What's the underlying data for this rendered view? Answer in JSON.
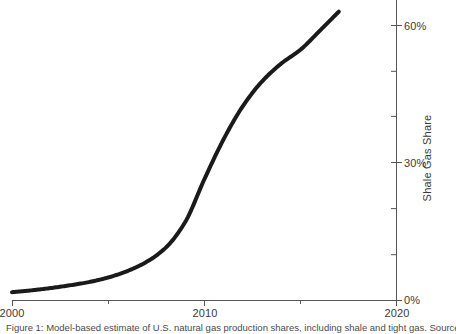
{
  "chart_data": {
    "type": "line",
    "title": "",
    "xlabel": "",
    "ylabel": "Shale Gas Share",
    "xlim": [
      2000,
      2020
    ],
    "ylim": [
      0,
      65
    ],
    "grid": false,
    "legend": "none",
    "series": [
      {
        "name": "Shale Gas Share",
        "color": "#1a1a1a",
        "linewidth": 4,
        "x": [
          2000,
          2001,
          2002,
          2003,
          2004,
          2005,
          2006,
          2007,
          2008,
          2009,
          2010,
          2011,
          2012,
          2013,
          2014,
          2015,
          2016,
          2017
        ],
        "values": [
          1.8,
          2.2,
          2.7,
          3.3,
          4.0,
          5.0,
          6.4,
          8.4,
          11.5,
          17.0,
          26.3,
          35.0,
          42.2,
          47.6,
          51.5,
          54.5,
          58.6,
          62.8
        ]
      }
    ],
    "xticks": [
      2000,
      2010,
      2020
    ],
    "xtick_labels": [
      "2000",
      "2010",
      "2020"
    ],
    "xminor_ticks": [
      2005,
      2015
    ],
    "yticks": [
      0,
      30,
      60
    ],
    "ytick_labels": [
      "0%",
      "30%",
      "60%"
    ],
    "yminor_ticks": [
      10,
      20,
      40,
      50
    ],
    "axis_position": {
      "y_axis": "right",
      "x_axis": "bottom"
    },
    "axis_color": "#555555"
  },
  "axes": {
    "y_axis_title": "Shale Gas Share",
    "x_tick_labels": [
      "2000",
      "2010",
      "2020"
    ],
    "y_tick_labels": [
      "0%",
      "30%",
      "60%"
    ]
  },
  "caption": {
    "text": "Figure 1: Model-based estimate of U.S. natural gas production shares, including shale and tight gas. Source: E..."
  }
}
